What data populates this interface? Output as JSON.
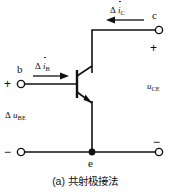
{
  "figure": {
    "caption": "(a) 共射极接法",
    "type": "npn-common-emitter-small-signal-circuit"
  },
  "terminals": {
    "base": {
      "label": "b",
      "polarity": "+"
    },
    "collector": {
      "label": "c",
      "polarity": "+"
    },
    "emitter": {
      "label": "e"
    },
    "bottom_right": {
      "polarity": "−"
    },
    "bottom_left": {
      "polarity": "−"
    }
  },
  "labels": {
    "base_current": {
      "delta": "Δ",
      "symbol": "i",
      "subscript": "B"
    },
    "collector_current": {
      "delta": "Δ",
      "symbol": "i",
      "subscript": "C"
    },
    "input_voltage": {
      "delta": "Δ",
      "symbol": "u",
      "subscript": "BE"
    },
    "output_voltage": {
      "symbol": "u",
      "subscript": "CE"
    }
  },
  "colors": {
    "line": "#111111",
    "background": "#ffffff",
    "text": "#111111"
  }
}
